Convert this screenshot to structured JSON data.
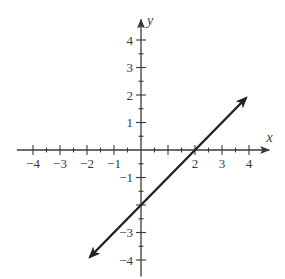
{
  "chart_data": {
    "type": "line",
    "title": "",
    "xlabel": "x",
    "ylabel": "y",
    "xlim": [
      -4.5,
      4.5
    ],
    "ylim": [
      -4.5,
      4.5
    ],
    "grid": false,
    "x_ticks": [
      -4,
      -3,
      -2,
      -1,
      2,
      3,
      4
    ],
    "y_ticks": [
      4,
      3,
      2,
      1,
      -1,
      -3,
      -4
    ],
    "x_tick_labels": [
      "−4",
      "−3",
      "−2",
      "−1",
      "2",
      "3",
      "4"
    ],
    "y_tick_labels": [
      "4",
      "3",
      "2",
      "1",
      "−1",
      "−3",
      "−4"
    ],
    "minor_ticks_step": 0.5,
    "series": [
      {
        "name": "y = x - 2",
        "equation": "y = x - 2",
        "slope": 1,
        "intercept": -2,
        "x": [
          -1.9,
          3.9
        ],
        "y": [
          -3.9,
          1.9
        ],
        "passes_through": [
          [
            0,
            -2
          ],
          [
            2,
            0
          ]
        ],
        "arrows": "both",
        "color": "#222222"
      }
    ]
  },
  "colors": {
    "axis": "#3a3a3a",
    "line": "#222222",
    "background": "#ffffff"
  }
}
